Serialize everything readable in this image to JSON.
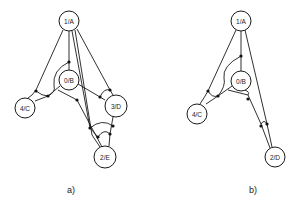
{
  "figure": {
    "panels": [
      {
        "id": "a",
        "caption": "a)",
        "nodes": [
          {
            "id": "1/A",
            "label": "1/A"
          },
          {
            "id": "0/B",
            "label": "0/B"
          },
          {
            "id": "4/C",
            "label": "4/C"
          },
          {
            "id": "3/D",
            "label": "3/D"
          },
          {
            "id": "2/E",
            "label": "2/E"
          }
        ]
      },
      {
        "id": "b",
        "caption": "b)",
        "nodes": [
          {
            "id": "1/A",
            "label": "1/A"
          },
          {
            "id": "0/B",
            "label": "0/B"
          },
          {
            "id": "4/C",
            "label": "4/C"
          },
          {
            "id": "2/D",
            "label": "2/D"
          }
        ]
      }
    ]
  }
}
